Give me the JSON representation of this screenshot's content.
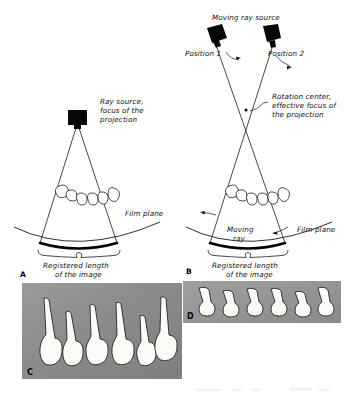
{
  "figure": {
    "background_color": "#ffffff",
    "ink_color": "#1a1a1a",
    "radiograph_gray": "#8f8f8f",
    "panels": [
      {
        "letter": "A",
        "kind": "diagram",
        "description": "Stationary ray source projection geometry"
      },
      {
        "letter": "B",
        "kind": "diagram",
        "description": "Moving ray source projection geometry"
      },
      {
        "letter": "C",
        "kind": "radiograph",
        "description": "Radiograph produced by stationary source"
      },
      {
        "letter": "D",
        "kind": "radiograph",
        "description": "Radiograph produced by moving source"
      }
    ]
  },
  "panel_a": {
    "letter": "A",
    "labels": {
      "source": "Ray source,\nfocus of the\nprojection",
      "source_line_1": "Ray source,",
      "source_line_2": "focus of the",
      "source_line_3": "projection",
      "film_plane": "Film plane",
      "registered_line_1": "Registered length",
      "registered_line_2": "of the image"
    },
    "tooth_count": 6
  },
  "panel_b": {
    "letter": "B",
    "labels": {
      "moving_source": "Moving ray source",
      "position_1": "Position 1",
      "position_2": "Position 2",
      "rotation_line_1": "Rotation center,",
      "rotation_line_2": "effective focus of",
      "rotation_line_3": "the projection",
      "moving_ray_line_1": "Moving",
      "moving_ray_line_2": "ray",
      "film_plane": "Film plane",
      "registered_line_1": "Registered  length",
      "registered_line_2": "of the image"
    },
    "tooth_count": 6
  },
  "panel_c": {
    "letter": "C",
    "background_color": "#8c8c8c",
    "tooth_count": 6,
    "tooth_style": "long tapered roots, overlapping crowns"
  },
  "panel_d": {
    "letter": "D",
    "background_color": "#969696",
    "tooth_count": 6,
    "tooth_style": "short compressed crowns, truncated roots"
  }
}
